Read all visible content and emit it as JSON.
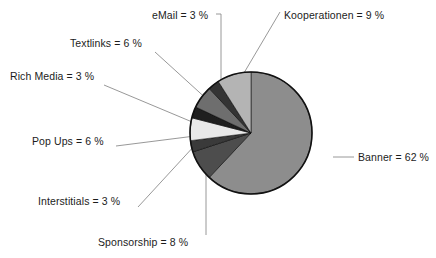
{
  "chart_data": {
    "type": "pie",
    "title": "",
    "subtitle": "",
    "xlabel": "",
    "ylabel": "",
    "legend_position": "none",
    "grid": false,
    "unit": "%",
    "start_angle_deg": 0,
    "direction": "clockwise",
    "total": 100,
    "categories": [
      "Banner",
      "Sponsorship",
      "Interstitials",
      "Pop Ups",
      "Rich Media",
      "Textlinks",
      "eMail",
      "Kooperationen"
    ],
    "values": [
      62,
      8,
      3,
      6,
      3,
      6,
      3,
      9
    ],
    "slices": [
      {
        "name": "Banner",
        "value": 62,
        "label": "Banner = 62 %",
        "color": "#8d8d8d",
        "start_deg": 0,
        "end_deg": 223.2,
        "label_x": 358,
        "label_y": 161,
        "label_anchor": "start",
        "leader": "M 333 157 L 354 157"
      },
      {
        "name": "Sponsorship",
        "value": 8,
        "label": "Sponsorship = 8 %",
        "color": "#4d4d4d",
        "start_deg": 223.2,
        "end_deg": 252.0,
        "label_x": 98,
        "label_y": 246,
        "label_anchor": "start",
        "leader": "M 206 158 L 206 235"
      },
      {
        "name": "Interstitials",
        "value": 3,
        "label": "Interstitials = 3 %",
        "color": "#3a3a3a",
        "start_deg": 252.0,
        "end_deg": 262.8,
        "label_x": 38,
        "label_y": 205,
        "label_anchor": "start",
        "leader": "M 196 144 L 138 207"
      },
      {
        "name": "Pop Ups",
        "value": 6,
        "label": "Pop Ups = 6 %",
        "color": "#e9e9e9",
        "start_deg": 262.8,
        "end_deg": 284.4,
        "label_x": 32,
        "label_y": 145,
        "label_anchor": "start",
        "leader": "M 195 136 L 116 146"
      },
      {
        "name": "Rich Media",
        "value": 3,
        "label": "Rich Media = 3 %",
        "color": "#1f1f1f",
        "start_deg": 284.4,
        "end_deg": 295.2,
        "label_x": 10,
        "label_y": 80,
        "label_anchor": "start",
        "leader": "M 197 124 L 104 85"
      },
      {
        "name": "Textlinks",
        "value": 6,
        "label": "Textlinks = 6 %",
        "color": "#6e6e6e",
        "start_deg": 295.2,
        "end_deg": 316.8,
        "label_x": 70,
        "label_y": 47,
        "label_anchor": "start",
        "leader": "M 210 102 L 155 52"
      },
      {
        "name": "eMail",
        "value": 3,
        "label": "eMail = 3 %",
        "color": "#343434",
        "start_deg": 316.8,
        "end_deg": 327.6,
        "label_x": 152,
        "label_y": 19,
        "label_anchor": "start",
        "leader": "M 221 94 L 221 14 L 216 14"
      },
      {
        "name": "Kooperationen",
        "value": 9,
        "label": "Kooperationen = 9 %",
        "color": "#b4b4b4",
        "start_deg": 327.6,
        "end_deg": 360.0,
        "label_x": 284,
        "label_y": 19,
        "label_anchor": "start",
        "leader": "M 241 78 L 280 12"
      }
    ],
    "geometry": {
      "cx": 251,
      "cy": 133,
      "r": 61
    }
  }
}
